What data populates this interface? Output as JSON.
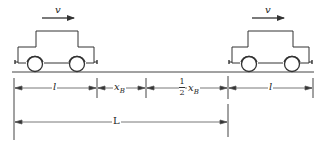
{
  "diagram": {
    "colors": {
      "stroke": "#333333",
      "background": "#ffffff"
    },
    "cars": [
      {
        "name": "left-car",
        "velocity_label": "v"
      },
      {
        "name": "right-car",
        "velocity_label": "v"
      }
    ],
    "dimensions": {
      "row1": [
        {
          "name": "car-length-left",
          "label": "l"
        },
        {
          "name": "x-b",
          "label": "x",
          "subscript": "B"
        },
        {
          "name": "half-x-b",
          "numerator": "1",
          "denominator": "2",
          "label": "x",
          "subscript": "B"
        },
        {
          "name": "car-length-right",
          "label": "l"
        }
      ],
      "row2": [
        {
          "name": "total-length",
          "label": "L"
        }
      ]
    }
  }
}
